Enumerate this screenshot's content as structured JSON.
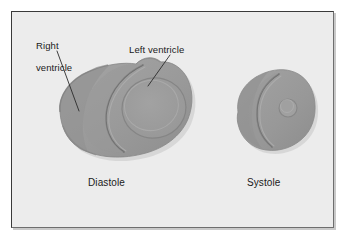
{
  "figure": {
    "type": "medical-illustration",
    "background_color": "#ececec",
    "page_color": "#ffffff",
    "frame_border_color": "#3a3a3a",
    "myocardium_fill": "#9a9a9a",
    "myocardium_shade": "#8c8c8c",
    "myocardium_highlight": "#a8a8a8",
    "cavity_fill": "#9e9e9e",
    "outline_color": "#7b7b7b",
    "leader_line_color": "#2b2b2b",
    "text_color": "#1a1a1a"
  },
  "labels": {
    "right_ventricle_line1": "Right",
    "right_ventricle_line2": "ventricle",
    "left_ventricle": "Left ventricle",
    "diastole": "Diastole",
    "systole": "Systole"
  },
  "panels": [
    {
      "name": "diastole",
      "caption": "Diastole",
      "description": "Dilated heart cross-section with large left ventricular cavity and crescent right ventricle",
      "relative_size": "large"
    },
    {
      "name": "systole",
      "caption": "Systole",
      "description": "Contracted heart cross-section with small left ventricular cavity and thin crescent right ventricle",
      "relative_size": "small"
    }
  ],
  "annotations": [
    {
      "label": "Right ventricle",
      "points_to": "right-ventricle-free-wall",
      "panel": "diastole"
    },
    {
      "label": "Left ventricle",
      "points_to": "left-ventricle-wall",
      "panel": "diastole"
    }
  ]
}
